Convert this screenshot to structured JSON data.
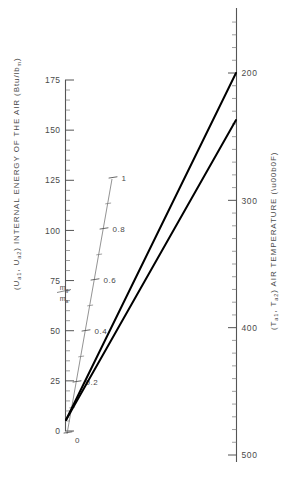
{
  "chart_data": {
    "type": "line",
    "title": "",
    "subtitle": "",
    "axes": {
      "left": {
        "name": "internal-energy-axis",
        "label": "INTERNAL ENERGY OF THE AIR",
        "label_full": "(Uₐ₁, Uₐ₂) INTERNAL ENERGY OF THE AIR (Btu/lbₘ)",
        "symbol_prefix": "(U",
        "symbol_sub_1": "a1",
        "symbol_mid": ", U",
        "symbol_sub_2": "a2",
        "symbol_suffix": ") INTERNAL ENERGY OF THE AIR (Btu/lb",
        "unit_sub": "m",
        "symbol_end": ")",
        "units": "Btu/lbm",
        "min": 0,
        "max": 175,
        "major_ticks": [
          0,
          25,
          50,
          75,
          100,
          125,
          150,
          175
        ],
        "major_tick_labels": [
          "0",
          "25",
          "50",
          "75",
          "100",
          "125",
          "150",
          "175"
        ],
        "minor_tick_step": 5,
        "orientation": "vertical",
        "direction": "increasing-upward"
      },
      "right": {
        "name": "air-temperature-axis",
        "label": "AIR TEMPERATURE",
        "label_full": "(Tₐ₁, Tₐ₂) AIR TEMPERATURE (°F)",
        "symbol_prefix": "(T",
        "symbol_sub_1": "a1",
        "symbol_mid": ", T",
        "symbol_sub_2": "a2",
        "symbol_suffix": ") AIR TEMPERATURE (°F)",
        "units": "°F",
        "min": 200,
        "max": 500,
        "major_ticks": [
          200,
          300,
          400,
          500
        ],
        "major_tick_labels": [
          "200",
          "300",
          "400",
          "500"
        ],
        "minor_tick_step": 10,
        "orientation": "vertical",
        "direction": "increasing-downward"
      },
      "diagonal": {
        "name": "mass-flow-ratio-scale",
        "label": "ṁg/ṁa",
        "numerator": "m",
        "numerator_sub": "g",
        "denominator": "m",
        "denominator_sub": "a",
        "units": "",
        "min": 0,
        "max": 1,
        "major_ticks": [
          0,
          0.2,
          0.4,
          0.6,
          0.8,
          1
        ],
        "major_tick_labels": [
          "0",
          "0.2",
          "0.4",
          "0.6",
          "0.8",
          "1"
        ],
        "minor_tick_step": 0.1,
        "orientation": "diagonal"
      }
    },
    "series": [
      {
        "name": "line-upper",
        "from": {
          "energy": 15,
          "x_px": 66,
          "y_px": 420
        },
        "to": {
          "temperature_f": 200,
          "x_px": 236,
          "y_px": 73
        },
        "style": "solid-heavy"
      },
      {
        "name": "line-lower",
        "from": {
          "energy": 15,
          "x_px": 66,
          "y_px": 420
        },
        "to": {
          "temperature_f": 227,
          "x_px": 236,
          "y_px": 120
        },
        "style": "solid-heavy"
      }
    ],
    "grid": false,
    "legend": null,
    "background_color": "#ffffff",
    "line_color": "#000000",
    "axis_color": "#555555"
  }
}
